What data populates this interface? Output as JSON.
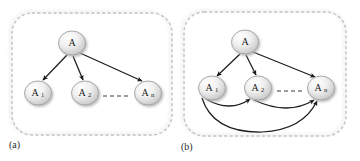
{
  "figure": {
    "background_color": "#ffffff",
    "edge_color": "#1c1c1c",
    "node_fill_light": "#fdfdfd",
    "node_fill_dark": "#c9c9c9",
    "node_stroke": "#9a9a9a",
    "panel_border_color": "#c2c2c2",
    "shadow_color": "#d5d5d5"
  },
  "panels": [
    {
      "id": "panel-a",
      "caption": "(a)",
      "nodes": [
        {
          "id": "a-root",
          "label": "A",
          "subscript": "",
          "cx": 72,
          "cy": 43
        },
        {
          "id": "a-n1",
          "label": "A",
          "subscript": "1",
          "cx": 38,
          "cy": 93
        },
        {
          "id": "a-n2",
          "label": "A",
          "subscript": "2",
          "cx": 85,
          "cy": 93
        },
        {
          "id": "a-nn",
          "label": "A",
          "subscript": "n",
          "cx": 148,
          "cy": 93
        }
      ],
      "edges": [
        {
          "id": "a-edge-root-n1",
          "from": "A",
          "to": "A1",
          "style": "straight"
        },
        {
          "id": "a-edge-root-n2",
          "from": "A",
          "to": "A2",
          "style": "straight"
        },
        {
          "id": "a-edge-root-nn",
          "from": "A",
          "to": "An",
          "style": "straight"
        }
      ],
      "ellipsis": {
        "id": "a-ellipsis",
        "style": "dashed",
        "x1": 103,
        "x2": 130,
        "y": 96
      }
    },
    {
      "id": "panel-b",
      "caption": "(b)",
      "nodes": [
        {
          "id": "b-root",
          "label": "A",
          "subscript": "",
          "cx": 245,
          "cy": 42
        },
        {
          "id": "b-n1",
          "label": "A",
          "subscript": "1",
          "cx": 212,
          "cy": 88
        },
        {
          "id": "b-n2",
          "label": "A",
          "subscript": "2",
          "cx": 258,
          "cy": 88
        },
        {
          "id": "b-nn",
          "label": "A",
          "subscript": "n",
          "cx": 321,
          "cy": 88
        }
      ],
      "edges": [
        {
          "id": "b-edge-root-n1",
          "from": "A",
          "to": "A1",
          "style": "straight"
        },
        {
          "id": "b-edge-root-n2",
          "from": "A",
          "to": "A2",
          "style": "straight"
        },
        {
          "id": "b-edge-root-nn",
          "from": "A",
          "to": "An",
          "style": "straight"
        },
        {
          "id": "b-edge-n1-n2",
          "from": "A1",
          "to": "A2",
          "style": "curved"
        },
        {
          "id": "b-edge-n2-nn",
          "from": "A2",
          "to": "An",
          "style": "curved"
        },
        {
          "id": "b-edge-n1-nn",
          "from": "A1",
          "to": "An",
          "style": "curved-long"
        }
      ],
      "ellipsis": {
        "id": "b-ellipsis",
        "style": "dashed",
        "x1": 277,
        "x2": 303,
        "y": 91
      }
    }
  ]
}
